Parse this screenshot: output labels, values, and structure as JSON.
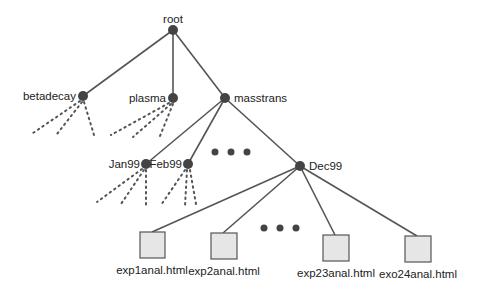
{
  "diagram": {
    "type": "tree",
    "title": "",
    "root": {
      "label": "root"
    },
    "level1": [
      {
        "label": "betadecay"
      },
      {
        "label": "plasma"
      },
      {
        "label": "masstrans"
      }
    ],
    "masstrans_children": [
      {
        "label": "Jan99"
      },
      {
        "label": "Feb99"
      },
      {
        "label": "Dec99"
      }
    ],
    "dec99_files": [
      {
        "label": "exp1anal.html"
      },
      {
        "label": "exp2anal.html"
      },
      {
        "label": "exp23anal.html"
      },
      {
        "label": "exo24anal.html"
      }
    ],
    "ellipsis_markers": 2,
    "colors": {
      "node": "#444444",
      "edge": "#555555",
      "file_box_fill": "#e6e6e6"
    }
  }
}
